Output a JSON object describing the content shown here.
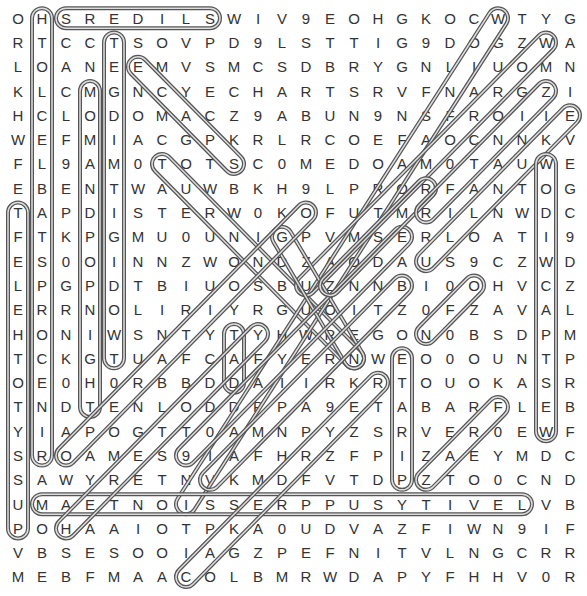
{
  "puzzle": {
    "type": "word-search",
    "rows": 24,
    "cols": 24,
    "grid": [
      "OHSREDILSWIV9EOHGKOCWTYG",
      "RTCCTSOVPD9LSTTIG9DOGZWA",
      "LOANEEMVSMCSDBRYGNLIUOMN",
      "KLCMGNCYECHARTSRVFNARGZI",
      "HCLODOMACZ9ABUN9NSFROIIE",
      "WEFMIACGPKRLRCOEFAOCNNKV",
      "FL9AM0TOTSC0MEDOAM0TAUWE",
      "EBENTWAUWBKH9LPRORFANTOG",
      "TAPDISTERW0KOFUTMRILNWDC",
      "FTKPGMU0UNIGPVMSERLOATI9",
      "ES0OINNZWONDZAODAUS9CZWD",
      "LPGPDTBIUOSBUZNNBI0OHVCZ",
      "ERRNOLIRIYRGUOITZ0FZAVAL",
      "HONIWSNTYTYHWREGON0BSDPM",
      "TCKGTUAFCAFYERNWEO0OUNTP",
      "OE0H0RBBDDAIIRKRTOUOKASR",
      "TNDTENLODDPPA9ETABARFLEB",
      "YIAPOGTT0AMNPYZSRVER0EWF",
      "SROAMES9IAFHRZFPIZAEYMDC",
      "SAWYRETNVKMDFVTDPZTO0CND",
      "UMAETNOISSERPPUSYTIVELVB",
      "POHAAIOTPKA0UDVAZFIWN9IF",
      "VBSESOOIAGZPEFNITVLNGCRR",
      "MEBFMAACOLBMRWDAPYFHHV0R"
    ],
    "found_words": [
      {
        "word": "SREDILS",
        "start": [
          0,
          2
        ],
        "end": [
          0,
          8
        ]
      },
      {
        "word": "HOLCELBATSPROCEN",
        "start": [
          0,
          1
        ],
        "end": [
          18,
          1
        ]
      },
      {
        "word": "TEGDIMAGIDOWT",
        "start": [
          1,
          4
        ],
        "end": [
          14,
          4
        ]
      },
      {
        "word": "MOMANDPOPNIGHT",
        "start": [
          3,
          3
        ],
        "end": [
          16,
          3
        ]
      },
      {
        "word": "TELEHOTYSSUP",
        "start": [
          8,
          0
        ],
        "end": [
          21,
          0
        ]
      },
      {
        "word": "EMCYACPS",
        "start": [
          2,
          5
        ],
        "end": [
          6,
          9
        ]
      },
      {
        "word": "TOUR-diagonal",
        "start": [
          6,
          6
        ],
        "end": [
          14,
          14
        ]
      },
      {
        "word": "WOD diagonal",
        "start": [
          0,
          20
        ],
        "end": [
          20,
          7
        ]
      },
      {
        "word": "WIOI diagonal",
        "start": [
          1,
          22
        ],
        "end": [
          11,
          12
        ]
      },
      {
        "word": "EKU diagonal",
        "start": [
          4,
          23
        ],
        "end": [
          10,
          17
        ]
      },
      {
        "word": "WODIWCAPTSEW",
        "start": [
          6,
          22
        ],
        "end": [
          17,
          22
        ]
      },
      {
        "word": "TAD",
        "start": [
          13,
          9
        ],
        "end": [
          15,
          9
        ]
      },
      {
        "word": "ETARIP",
        "start": [
          14,
          16
        ],
        "end": [
          19,
          16
        ]
      },
      {
        "word": "MAETNOISSERPPUSYTIVEL",
        "start": [
          20,
          1
        ],
        "end": [
          20,
          21
        ]
      },
      {
        "word": "ON diagonal",
        "start": [
          11,
          19
        ],
        "end": [
          13,
          17
        ]
      },
      {
        "word": "FRZ diagonal",
        "start": [
          16,
          20
        ],
        "end": [
          19,
          17
        ]
      },
      {
        "word": "RC diagonal",
        "start": [
          15,
          15
        ],
        "end": [
          23,
          7
        ]
      },
      {
        "word": "TGN diagonal",
        "start": [
          9,
          11
        ],
        "end": [
          14,
          14
        ]
      },
      {
        "word": "O9 diagonal",
        "start": [
          18,
          2
        ],
        "end": [
          8,
          12
        ]
      },
      {
        "word": "9V diagonal",
        "start": [
          18,
          7
        ],
        "end": [
          9,
          16
        ]
      },
      {
        "word": "VH diagonal",
        "start": [
          19,
          8
        ],
        "end": [
          11,
          16
        ]
      },
      {
        "word": "H diagonal",
        "start": [
          21,
          2
        ],
        "end": [
          13,
          10
        ]
      },
      {
        "word": "B diagonal",
        "start": [
          11,
          13
        ],
        "end": [
          7,
          17
        ]
      },
      {
        "word": "R diagonal",
        "start": [
          8,
          17
        ],
        "end": [
          3,
          22
        ]
      }
    ]
  }
}
